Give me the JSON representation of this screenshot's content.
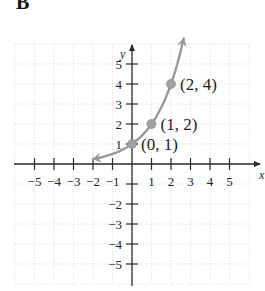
{
  "panel_label": "B",
  "chart_data": {
    "type": "line",
    "title": "",
    "xlabel": "x",
    "ylabel": "y",
    "xlim": [
      -5.5,
      5.5
    ],
    "ylim": [
      -6,
      6
    ],
    "grid": true,
    "x_ticks": [
      -5,
      -4,
      -3,
      -2,
      -1,
      1,
      2,
      3,
      4,
      5
    ],
    "y_ticks": [
      -5,
      -4,
      -3,
      -2,
      -1,
      1,
      2,
      3,
      4,
      5
    ],
    "x_tick_labels": [
      "−5",
      "−4",
      "−3",
      "−2",
      "−1",
      "1",
      "2",
      "3",
      "4",
      "5"
    ],
    "y_tick_labels": [
      "−5",
      "−4",
      "−3",
      "−2",
      "",
      "1",
      "2",
      "3",
      "4",
      "5"
    ],
    "series": [
      {
        "name": "y = 2^x",
        "function": "2^x",
        "x_range": [
          -2.0,
          2.65
        ],
        "arrows": "both",
        "color": "#999999"
      }
    ],
    "points": [
      {
        "x": 0,
        "y": 1,
        "label": "(0, 1)"
      },
      {
        "x": 1,
        "y": 2,
        "label": "(1, 2)"
      },
      {
        "x": 2,
        "y": 4,
        "label": "(2, 4)"
      }
    ],
    "colors": {
      "axis": "#2a2a2a",
      "grid": "#d8d8d8",
      "curve": "#999999",
      "point": "#a0a0a0"
    }
  }
}
